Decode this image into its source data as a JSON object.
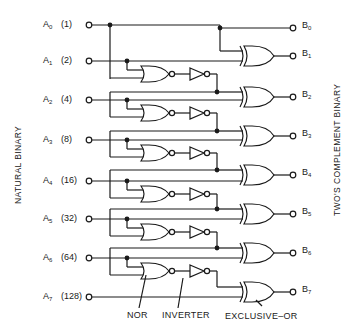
{
  "diagram": {
    "left_axis_label": "NATURAL BINARY",
    "right_axis_label": "TWO'S COMPLEMENT BINARY",
    "inputs": [
      {
        "name": "A",
        "sub": "0",
        "weight": "(1)",
        "y": 25
      },
      {
        "name": "A",
        "sub": "1",
        "weight": "(2)",
        "y": 61
      },
      {
        "name": "A",
        "sub": "2",
        "weight": "(4)",
        "y": 100
      },
      {
        "name": "A",
        "sub": "3",
        "weight": "(8)",
        "y": 140
      },
      {
        "name": "A",
        "sub": "4",
        "weight": "(16)",
        "y": 181
      },
      {
        "name": "A",
        "sub": "5",
        "weight": "(32)",
        "y": 219
      },
      {
        "name": "A",
        "sub": "6",
        "weight": "(64)",
        "y": 258
      },
      {
        "name": "A",
        "sub": "7",
        "weight": "(128)",
        "y": 297
      }
    ],
    "outputs": [
      {
        "name": "B",
        "sub": "0",
        "y": 28
      },
      {
        "name": "B",
        "sub": "1",
        "y": 56
      },
      {
        "name": "B",
        "sub": "2",
        "y": 97
      },
      {
        "name": "B",
        "sub": "3",
        "y": 136
      },
      {
        "name": "B",
        "sub": "4",
        "y": 175
      },
      {
        "name": "B",
        "sub": "5",
        "y": 214
      },
      {
        "name": "B",
        "sub": "6",
        "y": 253
      },
      {
        "name": "B",
        "sub": "7",
        "y": 292
      }
    ],
    "captions": {
      "nor": "NOR",
      "inverter": "INVERTER",
      "xor": "EXCLUSIVE–OR"
    },
    "colors": {
      "ink": "#1a1a1a",
      "background": "#ffffff"
    }
  }
}
